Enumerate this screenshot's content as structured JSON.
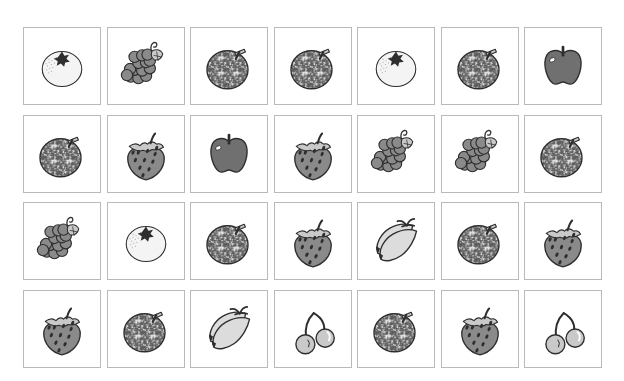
{
  "canvas": {
    "width": 624,
    "height": 381,
    "background": "#ffffff",
    "title": "Fruit picture card grid"
  },
  "grid": {
    "rows": 4,
    "columns": 7,
    "cell_width": 78,
    "cell_height": 78,
    "origin_x": 23,
    "origin_y": 27,
    "step_x": 83.5,
    "step_y": 87.6,
    "cell_border_color": "#b9b9b9",
    "cell_background": "#ffffff"
  },
  "palette": {
    "outline": "#2e2e2e",
    "fill_mid_gray": "#8a8a8a",
    "fill_dark_gray": "#707070",
    "fill_light_gray": "#c9c9c9",
    "fill_near_white": "#f4f4f4",
    "fill_banana": "#dcdcdc",
    "speckle": "#5d5d5d",
    "highlight": "#ffffff"
  },
  "legend": [
    {
      "key": "orange_light",
      "label": "Orange (light, star stem)"
    },
    {
      "key": "orange_textured",
      "label": "Orange (textured, leaf stem)"
    },
    {
      "key": "grapes",
      "label": "Grapes"
    },
    {
      "key": "apple",
      "label": "Apple"
    },
    {
      "key": "strawberry",
      "label": "Strawberry"
    },
    {
      "key": "banana",
      "label": "Bananas"
    },
    {
      "key": "cherry",
      "label": "Cherries"
    }
  ],
  "cells": [
    {
      "row": 1,
      "col": 1,
      "fruit": "orange_light",
      "label": "Orange"
    },
    {
      "row": 1,
      "col": 2,
      "fruit": "grapes",
      "label": "Grapes"
    },
    {
      "row": 1,
      "col": 3,
      "fruit": "orange_textured",
      "label": "Orange"
    },
    {
      "row": 1,
      "col": 4,
      "fruit": "orange_textured",
      "label": "Orange"
    },
    {
      "row": 1,
      "col": 5,
      "fruit": "orange_light",
      "label": "Orange"
    },
    {
      "row": 1,
      "col": 6,
      "fruit": "orange_textured",
      "label": "Orange"
    },
    {
      "row": 1,
      "col": 7,
      "fruit": "apple",
      "label": "Apple"
    },
    {
      "row": 2,
      "col": 1,
      "fruit": "orange_textured",
      "label": "Orange"
    },
    {
      "row": 2,
      "col": 2,
      "fruit": "strawberry",
      "label": "Strawberry"
    },
    {
      "row": 2,
      "col": 3,
      "fruit": "apple",
      "label": "Apple"
    },
    {
      "row": 2,
      "col": 4,
      "fruit": "strawberry",
      "label": "Strawberry"
    },
    {
      "row": 2,
      "col": 5,
      "fruit": "grapes",
      "label": "Grapes"
    },
    {
      "row": 2,
      "col": 6,
      "fruit": "grapes",
      "label": "Grapes"
    },
    {
      "row": 2,
      "col": 7,
      "fruit": "orange_textured",
      "label": "Orange"
    },
    {
      "row": 3,
      "col": 1,
      "fruit": "grapes",
      "label": "Grapes"
    },
    {
      "row": 3,
      "col": 2,
      "fruit": "orange_light",
      "label": "Orange"
    },
    {
      "row": 3,
      "col": 3,
      "fruit": "orange_textured",
      "label": "Orange"
    },
    {
      "row": 3,
      "col": 4,
      "fruit": "strawberry",
      "label": "Strawberry"
    },
    {
      "row": 3,
      "col": 5,
      "fruit": "banana",
      "label": "Bananas"
    },
    {
      "row": 3,
      "col": 6,
      "fruit": "orange_textured",
      "label": "Orange"
    },
    {
      "row": 3,
      "col": 7,
      "fruit": "strawberry",
      "label": "Strawberry"
    },
    {
      "row": 4,
      "col": 1,
      "fruit": "strawberry",
      "label": "Strawberry"
    },
    {
      "row": 4,
      "col": 2,
      "fruit": "orange_textured",
      "label": "Orange"
    },
    {
      "row": 4,
      "col": 3,
      "fruit": "banana",
      "label": "Bananas"
    },
    {
      "row": 4,
      "col": 4,
      "fruit": "cherry",
      "label": "Cherries"
    },
    {
      "row": 4,
      "col": 5,
      "fruit": "orange_textured",
      "label": "Orange"
    },
    {
      "row": 4,
      "col": 6,
      "fruit": "strawberry",
      "label": "Strawberry"
    },
    {
      "row": 4,
      "col": 7,
      "fruit": "cherry",
      "label": "Cherries"
    }
  ]
}
